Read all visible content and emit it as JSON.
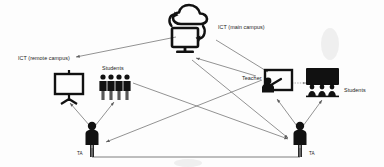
{
  "diagram": {
    "background_color": "#fdfdfd",
    "ink_color": "#111111",
    "line_color": "#6f6f6f",
    "width": 384,
    "height": 167,
    "nodes": [
      {
        "id": "ict-main",
        "label": "ICT (main campus)",
        "icon": "cloud-sync-monitor-icon",
        "x": 190,
        "y": 30,
        "label_x": 218,
        "label_y": 28
      },
      {
        "id": "ict-remote",
        "label": "ICT (remote campus)",
        "icon": "text-label",
        "x": 58,
        "y": 58,
        "label_x": 18,
        "label_y": 59
      },
      {
        "id": "projector-remote",
        "label": "",
        "icon": "projector-screen-icon",
        "x": 68,
        "y": 82
      },
      {
        "id": "students-remote",
        "label": "Students",
        "icon": "student-group-icon",
        "x": 115,
        "y": 82,
        "label_x": 103,
        "label_y": 70
      },
      {
        "id": "teacher-main",
        "label": "Teacher",
        "icon": "teacher-presenting-icon",
        "x": 272,
        "y": 84,
        "label_x": 243,
        "label_y": 79
      },
      {
        "id": "students-main",
        "label": "Students",
        "icon": "classroom-audience-icon",
        "x": 322,
        "y": 82,
        "label_x": 345,
        "label_y": 91
      },
      {
        "id": "ta-remote",
        "label": "TA",
        "icon": "person-icon",
        "x": 92,
        "y": 130,
        "label_x": 78,
        "label_y": 153
      },
      {
        "id": "ta-main",
        "label": "TA",
        "icon": "person-icon",
        "x": 300,
        "y": 130,
        "label_x": 310,
        "label_y": 153
      }
    ],
    "edges": [
      {
        "from": "ict-main",
        "to": "ict-remote",
        "style": "arrow"
      },
      {
        "from": "ict-main",
        "to": "teacher-main",
        "style": "arrow"
      },
      {
        "from": "ict-main",
        "to": "ta-main",
        "style": "arrow"
      },
      {
        "from": "ta-remote",
        "to": "projector-remote",
        "style": "arrow"
      },
      {
        "from": "ta-remote",
        "to": "students-remote",
        "style": "arrow"
      },
      {
        "from": "ta-main",
        "to": "teacher-main",
        "style": "arrow"
      },
      {
        "from": "ta-main",
        "to": "students-main",
        "style": "arrow"
      },
      {
        "from": "teacher-main",
        "to": "students-main",
        "style": "dotted-arrow"
      },
      {
        "from": "students-remote",
        "to": "ta-main",
        "style": "arrow"
      },
      {
        "from": "teacher-main",
        "to": "ta-remote",
        "style": "arrow"
      },
      {
        "from": "ta-remote",
        "to": "ta-main",
        "style": "line"
      }
    ]
  }
}
